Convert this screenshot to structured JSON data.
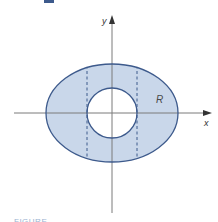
{
  "figure": {
    "type": "region-diagram",
    "axes": {
      "x_label": "x",
      "y_label": "y"
    },
    "region_label": "R",
    "caption": "FIGURE",
    "colors": {
      "fill": "#c9d7ea",
      "outline": "#3d5a8c",
      "axis": "#7a7a7a",
      "dashed": "#3d5a8c",
      "hole": "#ffffff"
    },
    "shapes": {
      "outer_ellipse": {
        "cx": 112,
        "cy": 113,
        "rx": 66,
        "ry": 49
      },
      "inner_circle": {
        "cx": 112,
        "cy": 113,
        "r": 25
      },
      "dashed_lines_x": [
        87,
        137
      ]
    }
  }
}
